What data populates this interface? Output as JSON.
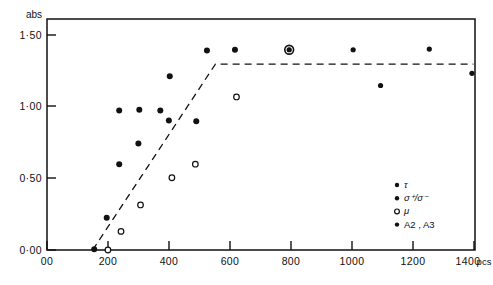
{
  "figure": {
    "background_color": "#ffffff",
    "ink_color": "#111111",
    "frame": {
      "left_px": 47,
      "right_px": 475,
      "top_px": 19,
      "bottom_px": 250
    }
  },
  "chart_data": {
    "type": "scatter",
    "title": "",
    "subtitle": "",
    "xlabel": "pcs",
    "ylabel": "abs",
    "ylabel_position": "above-axis-top",
    "xlim": [
      0,
      1405
    ],
    "ylim": [
      0.0,
      1.615
    ],
    "grid": false,
    "legend_position": "inside-lower-right",
    "x_ticks": [
      {
        "value": 0,
        "label": "00"
      },
      {
        "value": 200,
        "label": "200"
      },
      {
        "value": 400,
        "label": "400"
      },
      {
        "value": 600,
        "label": "600"
      },
      {
        "value": 800,
        "label": "800"
      },
      {
        "value": 1000,
        "label": "1000"
      },
      {
        "value": 1200,
        "label": "1200"
      },
      {
        "value": 1400,
        "label": "1400"
      }
    ],
    "x_axis_unit_label": "pcs",
    "y_ticks": [
      {
        "value": 0.0,
        "label": "0·00"
      },
      {
        "value": 0.5,
        "label": "0·50"
      },
      {
        "value": 1.0,
        "label": "1·00"
      },
      {
        "value": 1.5,
        "label": "1·50"
      }
    ],
    "series": [
      {
        "name": "tau",
        "legend_label": "τ",
        "marker": "filled-circle",
        "marker_size_px": 3.0,
        "points": [
          {
            "x": 155,
            "y": 0.005
          },
          {
            "x": 196,
            "y": 0.225
          },
          {
            "x": 237,
            "y": 0.6
          },
          {
            "x": 237,
            "y": 0.975
          },
          {
            "x": 300,
            "y": 0.745
          },
          {
            "x": 303,
            "y": 0.98
          },
          {
            "x": 372,
            "y": 0.975
          },
          {
            "x": 400,
            "y": 0.905
          },
          {
            "x": 403,
            "y": 1.215
          },
          {
            "x": 490,
            "y": 0.9
          },
          {
            "x": 525,
            "y": 1.395
          },
          {
            "x": 617,
            "y": 1.4
          }
        ]
      },
      {
        "name": "sigma-plus-sigma-minus",
        "legend_label": "σ⁺/σ⁻",
        "marker": "filled-circle",
        "marker_size_px": 2.6,
        "points": [
          {
            "x": 795,
            "y": 1.4
          },
          {
            "x": 1005,
            "y": 1.4
          },
          {
            "x": 1255,
            "y": 1.405
          },
          {
            "x": 1095,
            "y": 1.15
          },
          {
            "x": 1395,
            "y": 1.235
          }
        ]
      },
      {
        "name": "mu",
        "legend_label": "μ",
        "marker": "open-circle",
        "marker_size_px": 2.8,
        "points": [
          {
            "x": 200,
            "y": 0.0
          },
          {
            "x": 243,
            "y": 0.13
          },
          {
            "x": 307,
            "y": 0.315
          },
          {
            "x": 410,
            "y": 0.505
          },
          {
            "x": 487,
            "y": 0.6
          },
          {
            "x": 622,
            "y": 1.07
          }
        ]
      },
      {
        "name": "A2-A3",
        "legend_label": "A2 , A3",
        "marker": "ringed-filled-circle",
        "marker_size_px": 4.4,
        "points": [
          {
            "x": 795,
            "y": 1.4
          }
        ]
      }
    ],
    "annotations": [
      {
        "type": "dashed-polyline",
        "name": "threshold-fit-line",
        "points": [
          {
            "x": 150,
            "y": 0.0
          },
          {
            "x": 553,
            "y": 1.3
          },
          {
            "x": 1400,
            "y": 1.3
          }
        ],
        "dash_pattern": "7,5",
        "line_width_px": 1.3
      }
    ],
    "legend_entries": [
      {
        "label": "τ",
        "marker": "filled-circle"
      },
      {
        "label": "σ⁺/σ⁻",
        "marker": "filled-circle"
      },
      {
        "label": "μ",
        "marker": "open-circle"
      },
      {
        "label": "A2 , A3",
        "marker": "filled-circle"
      }
    ]
  }
}
